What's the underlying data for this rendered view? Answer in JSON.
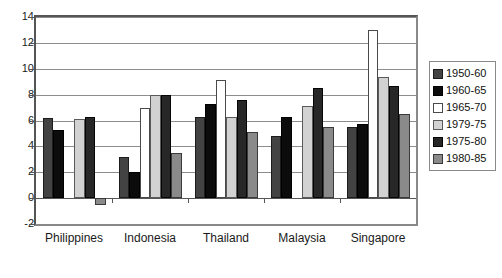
{
  "chart_data": {
    "type": "bar",
    "title": "",
    "subtitle": "",
    "xlabel": "",
    "ylabel": "",
    "ylim": [
      -2,
      14
    ],
    "ytick_step": 2,
    "yticks": [
      14,
      12,
      10,
      8,
      6,
      4,
      2,
      0,
      -2
    ],
    "grid": true,
    "legend_position": "right",
    "categories": [
      "Philippines",
      "Indonesia",
      "Thailand",
      "Malaysia",
      "Singapore"
    ],
    "series": [
      {
        "name": "1950-60",
        "color": "#434343",
        "values": [
          6.2,
          3.2,
          6.3,
          4.8,
          5.5
        ]
      },
      {
        "name": "1960-65",
        "color": "#0c0c0c",
        "values": [
          5.3,
          2.0,
          7.3,
          6.3,
          5.7
        ]
      },
      {
        "name": "1965-70",
        "color": "#ffffff",
        "values": [
          0.0,
          7.0,
          9.1,
          0.0,
          13.0
        ]
      },
      {
        "name": "1979-75",
        "color": "#d2d2d2",
        "values": [
          6.1,
          8.0,
          6.3,
          7.1,
          9.4
        ]
      },
      {
        "name": "1975-80",
        "color": "#272727",
        "values": [
          6.3,
          8.0,
          7.6,
          8.5,
          8.7
        ]
      },
      {
        "name": "1980-85",
        "color": "#8a8a8a",
        "values": [
          -0.5,
          3.5,
          5.1,
          5.5,
          6.5
        ]
      }
    ]
  },
  "legend": {
    "items": [
      {
        "label": "1950-60"
      },
      {
        "label": "1960-65"
      },
      {
        "label": "1965-70"
      },
      {
        "label": "1979-75"
      },
      {
        "label": "1975-80"
      },
      {
        "label": "1980-85"
      }
    ]
  },
  "axis": {
    "y_labels": [
      "14",
      "12",
      "10",
      "8",
      "6",
      "4",
      "2",
      "0",
      "-2"
    ]
  }
}
